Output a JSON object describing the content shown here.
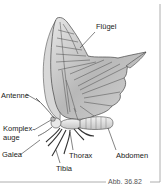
{
  "figure": {
    "caption": "Abb. 36.82",
    "labels": {
      "wing": "Flügel",
      "antenna": "Antenne",
      "compound_eye_1": "Komplex-",
      "compound_eye_2": "auge",
      "galea": "Galea",
      "thorax": "Thorax",
      "abdomen": "Abdomen",
      "tibia": "Tibia"
    },
    "colors": {
      "wing_fill": "#c8c8c8",
      "wing_vein": "#555555",
      "frame": "#888888"
    }
  }
}
